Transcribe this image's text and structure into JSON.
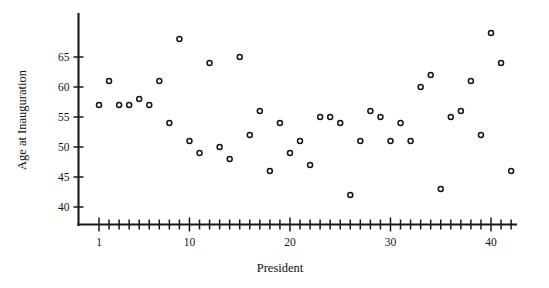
{
  "chart_data": {
    "type": "scatter",
    "title": "",
    "xlabel": "President",
    "ylabel": "Age at Inauguration",
    "xlim": [
      0,
      43
    ],
    "ylim": [
      38,
      70
    ],
    "grid": false,
    "legend": "none",
    "x_ticks_major": [
      1,
      10,
      20,
      30,
      40
    ],
    "x_ticks_minor_step": 1,
    "y_ticks": [
      40,
      45,
      50,
      55,
      60,
      65
    ],
    "marker": "open-circle",
    "marker_color": "#141414",
    "x": [
      1,
      2,
      3,
      4,
      5,
      6,
      7,
      8,
      9,
      10,
      11,
      12,
      13,
      14,
      15,
      16,
      17,
      18,
      19,
      20,
      21,
      22,
      23,
      24,
      25,
      26,
      27,
      28,
      29,
      30,
      31,
      32,
      33,
      34,
      35,
      36,
      37,
      38,
      39,
      40,
      41,
      42
    ],
    "values": [
      57,
      61,
      57,
      57,
      58,
      57,
      61,
      54,
      68,
      51,
      49,
      64,
      50,
      48,
      65,
      52,
      56,
      46,
      54,
      49,
      51,
      47,
      55,
      55,
      54,
      42,
      51,
      56,
      55,
      51,
      54,
      51,
      60,
      62,
      43,
      55,
      56,
      61,
      52,
      69,
      64,
      46
    ],
    "n_points": 42
  },
  "axis": {
    "ylabel": "Age at Inauguration",
    "xlabel": "President",
    "y_tick_labels": [
      "40",
      "45",
      "50",
      "55",
      "60",
      "65"
    ],
    "x_tick_labels": [
      "1",
      "10",
      "20",
      "30",
      "40"
    ]
  }
}
